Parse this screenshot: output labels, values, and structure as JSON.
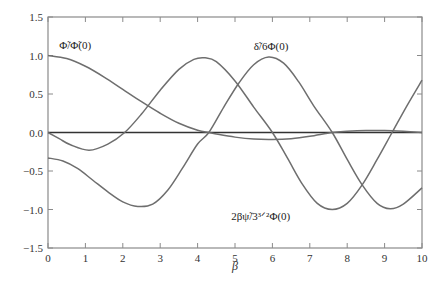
{
  "chart_data": {
    "type": "line",
    "title": "",
    "xlabel": "β",
    "ylabel": "",
    "xlim": [
      0,
      10
    ],
    "ylim": [
      -1.5,
      1.5
    ],
    "grid": false,
    "legend": "none (curves labeled inline)",
    "x_ticks": [
      0,
      1,
      2,
      3,
      4,
      5,
      6,
      7,
      8,
      9,
      10
    ],
    "x_tick_labels": [
      "0",
      "1",
      "2",
      "3",
      "4",
      "5",
      "6",
      "7",
      "8",
      "9",
      "10"
    ],
    "y_ticks": [
      -1.5,
      -1.0,
      -0.5,
      0.0,
      0.5,
      1.0,
      1.5
    ],
    "y_tick_labels": [
      "−1.5",
      "−1.0",
      "−0.5",
      "0.0",
      "0.5",
      "1.0",
      "1.5"
    ],
    "zero_line": true,
    "series": [
      {
        "name": "Φ̃/Φ̃(0)",
        "label_pos": {
          "x": 0.3,
          "y": 1.08
        },
        "x": [
          0,
          0.5,
          1.0,
          1.5,
          2.0,
          2.5,
          3.0,
          3.5,
          4.0,
          4.3,
          4.5,
          5.0,
          5.5,
          6.0,
          6.5,
          7.0,
          7.6,
          8.0,
          8.5,
          9.0,
          9.5,
          10.0
        ],
        "values": [
          1.0,
          0.96,
          0.86,
          0.72,
          0.56,
          0.4,
          0.25,
          0.12,
          0.03,
          0.0,
          -0.02,
          -0.06,
          -0.085,
          -0.09,
          -0.08,
          -0.05,
          0.0,
          0.015,
          0.025,
          0.025,
          0.015,
          0.0
        ]
      },
      {
        "name": "δ̃/6Φ(0)",
        "label_pos": {
          "x": 5.5,
          "y": 1.07
        },
        "x": [
          0,
          0.3,
          0.6,
          1.1,
          1.6,
          2.05,
          2.5,
          3.0,
          3.5,
          3.9,
          4.2,
          4.5,
          5.0,
          5.5,
          6.0,
          6.4,
          6.8,
          7.2,
          7.6,
          8.0,
          8.4,
          8.8,
          9.2,
          9.6,
          10.0
        ],
        "values": [
          0.0,
          -0.08,
          -0.16,
          -0.23,
          -0.15,
          0.0,
          0.24,
          0.55,
          0.82,
          0.95,
          0.97,
          0.92,
          0.67,
          0.33,
          0.0,
          -0.33,
          -0.67,
          -0.92,
          -1.0,
          -0.92,
          -0.68,
          -0.35,
          0.0,
          0.35,
          0.68
        ]
      },
      {
        "name": "2βψ̃/3^{3/2}Φ(0)",
        "label_pos": {
          "x": 4.9,
          "y": -1.13
        },
        "x": [
          0,
          0.4,
          0.8,
          1.2,
          1.6,
          2.0,
          2.4,
          2.8,
          3.2,
          3.6,
          4.0,
          4.3,
          4.7,
          5.1,
          5.5,
          5.9,
          6.3,
          6.7,
          7.1,
          7.6,
          8.0,
          8.4,
          8.8,
          9.15,
          9.5,
          10.0
        ],
        "values": [
          -0.33,
          -0.37,
          -0.47,
          -0.62,
          -0.77,
          -0.9,
          -0.96,
          -0.93,
          -0.75,
          -0.46,
          -0.15,
          0.0,
          0.33,
          0.64,
          0.88,
          0.98,
          0.9,
          0.66,
          0.35,
          0.0,
          -0.35,
          -0.68,
          -0.92,
          -0.99,
          -0.93,
          -0.72
        ]
      }
    ]
  },
  "colors": {
    "axis": "#8a8a8a",
    "curve": "#6e6e6e",
    "zero_line": "#333333",
    "text": "#333333"
  }
}
